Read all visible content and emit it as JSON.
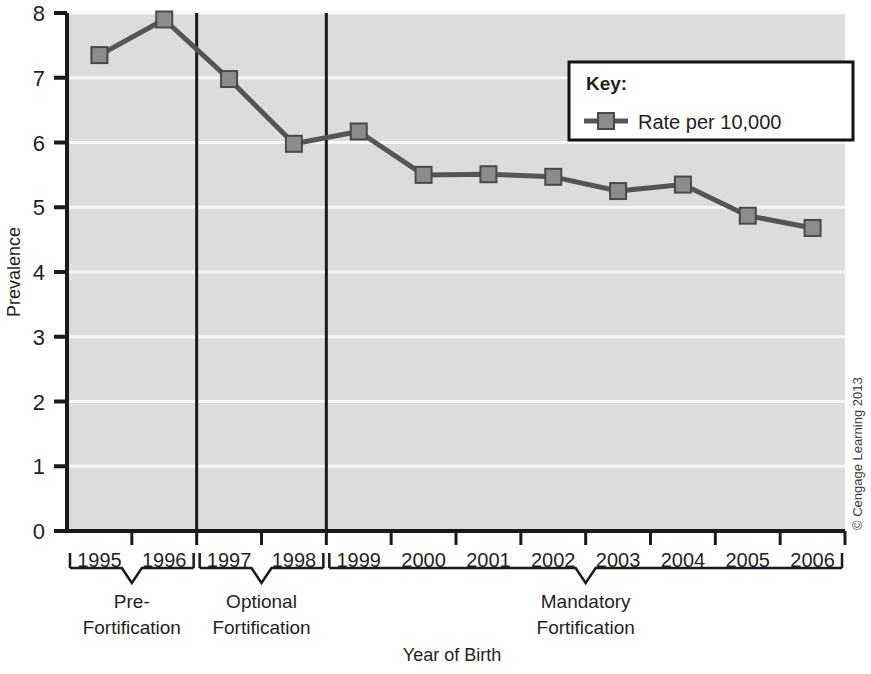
{
  "chart_data": {
    "type": "line",
    "title": "",
    "xlabel": "Year of Birth",
    "ylabel": "Prevalence",
    "categories": [
      "1995",
      "1996",
      "1997",
      "1998",
      "1999",
      "2000",
      "2001",
      "2002",
      "2003",
      "2004",
      "2005",
      "2006"
    ],
    "series": [
      {
        "name": "Rate per 10,000",
        "values": [
          7.35,
          7.9,
          6.98,
          5.98,
          6.17,
          5.5,
          5.51,
          5.47,
          5.25,
          5.35,
          4.87,
          4.68
        ]
      }
    ],
    "ylim": [
      0,
      8
    ],
    "yticks": [
      0,
      1,
      2,
      3,
      4,
      5,
      6,
      7,
      8
    ],
    "ytick_labels": [
      "0",
      "1",
      "2",
      "3",
      "4",
      "5",
      "6",
      "7",
      "8"
    ],
    "grid": "horizontal-white-lines-on-gray-panel",
    "legend_position": "top-right-inside",
    "annotations": [
      {
        "label": "Pre-Fortification",
        "span_start": "1995",
        "span_end": "1996"
      },
      {
        "label": "Optional Fortification",
        "span_start": "1997",
        "span_end": "1998"
      },
      {
        "label": "Mandatory Fortification",
        "span_start": "1999",
        "span_end": "2006"
      }
    ],
    "dividers": [
      "after-1996",
      "after-1998"
    ]
  },
  "axis": {
    "y_title": "Prevalence",
    "x_title": "Year of Birth",
    "y_ticks": [
      "8",
      "7",
      "6",
      "5",
      "4",
      "3",
      "2",
      "1",
      "0"
    ],
    "x_ticks": [
      "1995",
      "1996",
      "1997",
      "1998",
      "1999",
      "2000",
      "2001",
      "2002",
      "2003",
      "2004",
      "2005",
      "2006"
    ]
  },
  "legend": {
    "title": "Key:",
    "entries": [
      {
        "label": "Rate per 10,000",
        "marker": "square-line-marker"
      }
    ]
  },
  "period_groups": [
    {
      "line1": "Pre-",
      "line2": "Fortification"
    },
    {
      "line1": "Optional",
      "line2": "Fortification"
    },
    {
      "line1": "Mandatory",
      "line2": "Fortification"
    }
  ],
  "credit": {
    "text": "© Cengage Learning 2013"
  },
  "colors": {
    "panel": "#dcdcdc",
    "gridline": "#f7f7f7",
    "series_line": "#555555",
    "marker_fill": "#8c8c8c",
    "marker_stroke": "#4a4a4a",
    "axis": "#1a1a1a",
    "text": "#1f1f1f",
    "legend_bg": "#ffffff"
  }
}
